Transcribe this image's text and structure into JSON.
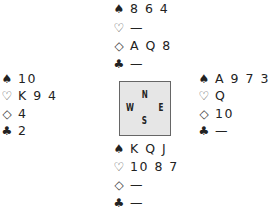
{
  "compass": {
    "north": "N",
    "west": "W",
    "east": "E",
    "south": "S"
  },
  "suits": {
    "spades": "♠",
    "hearts": "♡",
    "diamonds": "◇",
    "clubs": "♣"
  },
  "hands": {
    "north": {
      "spades": "8 6 4",
      "hearts": "—",
      "diamonds": "A Q 8",
      "clubs": "—"
    },
    "west": {
      "spades": "10",
      "hearts": "K 9 4",
      "diamonds": "4",
      "clubs": "2"
    },
    "east": {
      "spades": "A 9 7 3",
      "hearts": "Q",
      "diamonds": "10",
      "clubs": "—"
    },
    "south": {
      "spades": "K Q J",
      "hearts": "10 8 7",
      "diamonds": "—",
      "clubs": "—"
    }
  }
}
